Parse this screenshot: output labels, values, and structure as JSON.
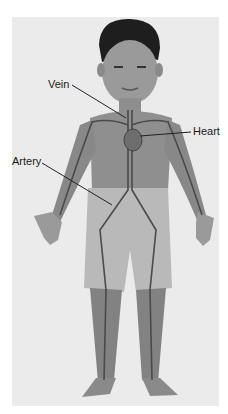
{
  "diagram": {
    "colors": {
      "background": "#ffffff",
      "panel": "#ebebeb",
      "skin": "#8f8f8f",
      "hair": "#1e1e1e",
      "shorts": "#b9b9b9",
      "vessel": "#4a4a4a",
      "leader": "#222222",
      "text": "#1a1a1a"
    },
    "labels": [
      {
        "id": "vein",
        "text": "Vein",
        "x": 48,
        "y": 79
      },
      {
        "id": "heart",
        "text": "Heart",
        "x": 193,
        "y": 126
      },
      {
        "id": "artery",
        "text": "Artery",
        "x": 12,
        "y": 156
      }
    ]
  }
}
